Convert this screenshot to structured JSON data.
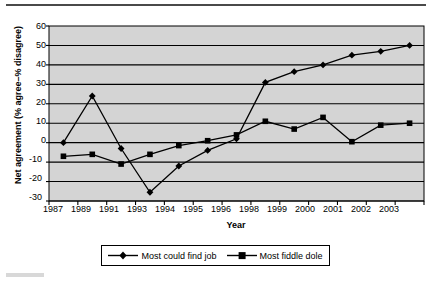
{
  "chart_data": {
    "type": "line",
    "title": "",
    "xlabel": "Year",
    "ylabel": "Net agreement (% agree–% disagree)",
    "categories": [
      "1987",
      "1989",
      "1991",
      "1993",
      "1994",
      "1995",
      "1996",
      "1998",
      "1999",
      "2000",
      "2001",
      "2002",
      "2003"
    ],
    "series": [
      {
        "name": "Most could find job",
        "marker": "diamond",
        "values": [
          0,
          24,
          -3,
          -25.5,
          -12,
          -4,
          2,
          31,
          36.5,
          40,
          45,
          47,
          50
        ]
      },
      {
        "name": "Most fiddle dole",
        "marker": "square",
        "values": [
          -7,
          -6,
          -11,
          -6,
          -1.5,
          1,
          4,
          11,
          7,
          13,
          0.5,
          9,
          10
        ]
      }
    ],
    "ylim": [
      -30,
      60
    ],
    "yticks": [
      "60",
      "50",
      "40",
      "30",
      "20",
      "10",
      "0",
      "-10",
      "-20",
      "-30"
    ],
    "grid": true,
    "legend_position": "bottom",
    "plot_background": "#d4d4d4",
    "line_color": "#000000"
  },
  "legend": {
    "entries": [
      {
        "label": "Most could find job"
      },
      {
        "label": "Most fiddle dole"
      }
    ]
  }
}
